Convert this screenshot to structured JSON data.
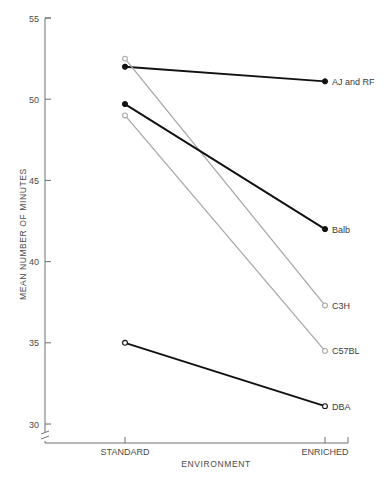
{
  "chart_data": {
    "type": "line",
    "title": "",
    "xlabel": "ENVIRONMENT",
    "ylabel": "MEAN NUMBER OF MINUTES",
    "categories": [
      "STANDARD",
      "ENRICHED"
    ],
    "x_tick_labels": [
      "STANDARD",
      "ENRICHED"
    ],
    "y_tick_labels": [
      "30",
      "35",
      "40",
      "45",
      "50",
      "55"
    ],
    "y_ticks": [
      30,
      35,
      40,
      45,
      50,
      55
    ],
    "ylim": [
      30,
      55
    ],
    "y_axis_break": true,
    "grid": false,
    "legend_position": "inline-right",
    "series": [
      {
        "name": "AJ and RF",
        "label": "AJ and RF",
        "values": [
          52.0,
          51.1
        ],
        "color": "#111111",
        "marker": "filled-circle"
      },
      {
        "name": "C3H",
        "label": "C3H",
        "values": [
          52.5,
          37.3
        ],
        "color": "#a8a8a8",
        "marker": "open-circle"
      },
      {
        "name": "Balb",
        "label": "Balb",
        "values": [
          49.7,
          42.0
        ],
        "color": "#111111",
        "marker": "filled-circle"
      },
      {
        "name": "C57BL",
        "label": "C57BL",
        "values": [
          49.0,
          34.5
        ],
        "color": "#a8a8a8",
        "marker": "open-circle"
      },
      {
        "name": "DBA",
        "label": "DBA",
        "values": [
          35.0,
          31.1
        ],
        "color": "#111111",
        "marker": "open-circle"
      }
    ]
  }
}
